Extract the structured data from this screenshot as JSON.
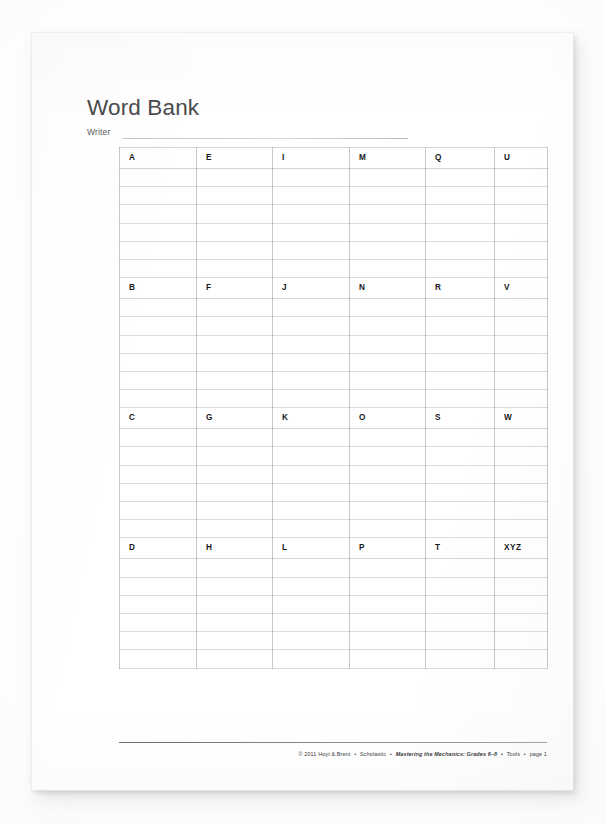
{
  "document": {
    "title": "Word Bank",
    "writer_label": "Writer",
    "writer_value": ""
  },
  "grid": {
    "columns": 6,
    "blank_rows_per_block": 6,
    "blocks": [
      {
        "letters": [
          "A",
          "E",
          "I",
          "M",
          "Q",
          "U"
        ]
      },
      {
        "letters": [
          "B",
          "F",
          "J",
          "N",
          "R",
          "V"
        ]
      },
      {
        "letters": [
          "C",
          "G",
          "K",
          "O",
          "S",
          "W"
        ]
      },
      {
        "letters": [
          "D",
          "H",
          "L",
          "P",
          "T",
          "XYZ"
        ]
      }
    ]
  },
  "footer": {
    "copyright": "© 2011 Hoyt & Brent",
    "publisher": "Scholastic",
    "work_title": "Mastering the Mechanics: Grades 6–8",
    "section": "Tools",
    "page": "page 1",
    "separator": "•"
  },
  "colors": {
    "page_background": "#ffffff",
    "title_text": "#4a4a4c",
    "letter_text": "#17171a",
    "grid_line": "#929294",
    "footer_rule": "#46464 8"
  }
}
